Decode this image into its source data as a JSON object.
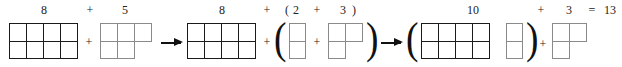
{
  "labels": {
    "a1": "8",
    "p1": "+",
    "a2": "5",
    "b1": "8",
    "p2": "+",
    "lp": "(",
    "b2": "2",
    "p3": "+",
    "b3": "3",
    "rp": ")",
    "c1": "10",
    "p4": "+",
    "c2": "3",
    "eq": "=",
    "result": "13"
  },
  "operators": {
    "plus": "+",
    "open_paren": "(",
    "close_paren": ")"
  },
  "groups": [
    {
      "name": "ten-frame-8",
      "count": 8,
      "style": "dark"
    },
    {
      "name": "block-5",
      "count": 5,
      "style": "light"
    },
    {
      "name": "ten-frame-8",
      "count": 8,
      "style": "dark"
    },
    {
      "name": "block-2",
      "count": 2,
      "style": "light"
    },
    {
      "name": "block-3",
      "count": 3,
      "style": "light"
    },
    {
      "name": "ten-frame-10",
      "count": 10,
      "style": "dark+light"
    },
    {
      "name": "block-3",
      "count": 3,
      "style": "light"
    }
  ],
  "equation": "8 + 5 = 8 + (2 + 3) = (8 + 2) + 3 = 10 + 3 = 13"
}
